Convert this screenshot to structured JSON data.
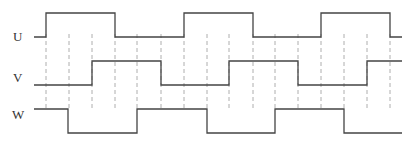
{
  "diagram": {
    "signals": [
      {
        "name": "U",
        "label_y": 41,
        "high_y": 13,
        "low_y": 37,
        "points": [
          [
            34,
            "L"
          ],
          [
            46,
            "H"
          ],
          [
            115,
            "L"
          ],
          [
            184,
            "H"
          ],
          [
            253,
            "L"
          ],
          [
            321,
            "H"
          ],
          [
            390,
            "L"
          ],
          [
            402,
            "L"
          ]
        ]
      },
      {
        "name": "V",
        "label_y": 82,
        "high_y": 61,
        "low_y": 85,
        "points": [
          [
            34,
            "L"
          ],
          [
            92,
            "H"
          ],
          [
            161,
            "L"
          ],
          [
            229,
            "H"
          ],
          [
            298,
            "L"
          ],
          [
            367,
            "H"
          ],
          [
            402,
            "H"
          ]
        ]
      },
      {
        "name": "W",
        "label_y": 119,
        "high_y": 109,
        "low_y": 133,
        "points": [
          [
            34,
            "H"
          ],
          [
            68,
            "L"
          ],
          [
            137,
            "H"
          ],
          [
            207,
            "L"
          ],
          [
            275,
            "H"
          ],
          [
            344,
            "L"
          ],
          [
            402,
            "L"
          ]
        ]
      }
    ],
    "guides": {
      "x": [
        46,
        69,
        92,
        115,
        137,
        161,
        184,
        207,
        229,
        253,
        275,
        298,
        321,
        344,
        367,
        390
      ],
      "y_top": 34,
      "y_bottom": 110
    },
    "colors": {
      "wave": "#444444",
      "guide": "#999999",
      "label": "#333333"
    }
  }
}
